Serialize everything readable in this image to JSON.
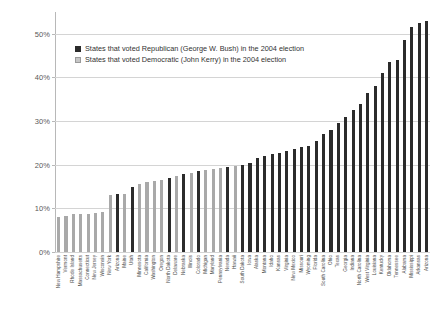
{
  "chart_data": {
    "type": "bar",
    "title": "",
    "xlabel": "",
    "ylabel": "",
    "ylim": [
      0,
      55
    ],
    "grid": true,
    "legend_position": "top-left",
    "ytick_labels": [
      "0%",
      "10%",
      "20%",
      "30%",
      "40%",
      "50%"
    ],
    "ytick_values": [
      0,
      10,
      20,
      30,
      40,
      50
    ],
    "legend": [
      {
        "label": "States that voted Republican (George W. Bush) in the 2004 election",
        "color": "#2b2b2b",
        "key": "rep"
      },
      {
        "label": "States that voted Democratic (John Kerry) in the 2004 election",
        "color": "#c6c6c6",
        "key": "dem"
      }
    ],
    "categories": [
      "New Hampshire",
      "Vermont",
      "Rhode Island",
      "Massachusetts",
      "Connecticut",
      "New Jersey",
      "Wisconsin",
      "New York",
      "Arizona",
      "Maine",
      "Utah",
      "Minnesota",
      "California",
      "Washington",
      "Oregon",
      "North Dakota",
      "Delaware",
      "Nebraska",
      "Illinois",
      "Colorado",
      "Michigan",
      "Maryland",
      "Pennsylvania",
      "Nevada",
      "Hawaii",
      "South Dakota",
      "Iowa",
      "Alaska",
      "Montana",
      "Idaho",
      "Kansas",
      "Virginia",
      "New Mexico",
      "Missouri",
      "Wyoming",
      "Florida",
      "South Carolina",
      "Ohio",
      "Texas",
      "Georgia",
      "Indiana",
      "North Carolina",
      "West Virginia",
      "Louisiana",
      "Kentucky",
      "Oklahoma",
      "Tennessee",
      "Alabama",
      "Mississippi",
      "Arkansas",
      "Arizona"
    ],
    "values": [
      8.0,
      8.3,
      8.6,
      8.7,
      8.8,
      9.0,
      9.2,
      13.0,
      13.2,
      13.4,
      15.0,
      15.5,
      16.0,
      16.3,
      16.6,
      17.0,
      17.5,
      17.8,
      18.2,
      18.5,
      18.8,
      19.0,
      19.2,
      19.4,
      19.6,
      20.0,
      20.4,
      21.5,
      22.0,
      22.4,
      22.8,
      23.2,
      23.6,
      24.0,
      24.4,
      25.5,
      27.0,
      28.0,
      29.5,
      31.0,
      32.5,
      34.0,
      36.5,
      38.0,
      41.0,
      43.5,
      44.0,
      48.5,
      51.5,
      52.5,
      53.0
    ],
    "parties": [
      "dem",
      "dem",
      "dem",
      "dem",
      "dem",
      "dem",
      "dem",
      "dem",
      "rep",
      "dem",
      "rep",
      "dem",
      "dem",
      "dem",
      "dem",
      "rep",
      "dem",
      "rep",
      "dem",
      "rep",
      "dem",
      "dem",
      "dem",
      "rep",
      "dem",
      "rep",
      "rep",
      "rep",
      "rep",
      "rep",
      "rep",
      "rep",
      "rep",
      "rep",
      "rep",
      "rep",
      "rep",
      "rep",
      "rep",
      "rep",
      "rep",
      "rep",
      "rep",
      "rep",
      "rep",
      "rep",
      "rep",
      "rep",
      "rep",
      "rep",
      "rep"
    ]
  }
}
